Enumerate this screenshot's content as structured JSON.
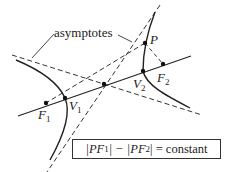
{
  "diagram": {
    "labels": {
      "asymptotes": "asymptotes",
      "P": "P",
      "F1": "F",
      "F1_sub": "1",
      "F2": "F",
      "F2_sub": "2",
      "V1": "V",
      "V1_sub": "1",
      "V2": "V",
      "V2_sub": "2"
    },
    "equation": {
      "part1": "|PF",
      "sub1": "1",
      "part2": "| − |PF",
      "sub2": "2",
      "part3": "| = constant"
    },
    "points": {
      "P": [
        145,
        43
      ],
      "F1": [
        46,
        103
      ],
      "F2": [
        163,
        64
      ],
      "V1": [
        65,
        98
      ],
      "V2": [
        143,
        71
      ],
      "center": [
        104,
        84
      ]
    },
    "colors": {
      "ink": "#222222",
      "background": "#ffffff"
    }
  }
}
